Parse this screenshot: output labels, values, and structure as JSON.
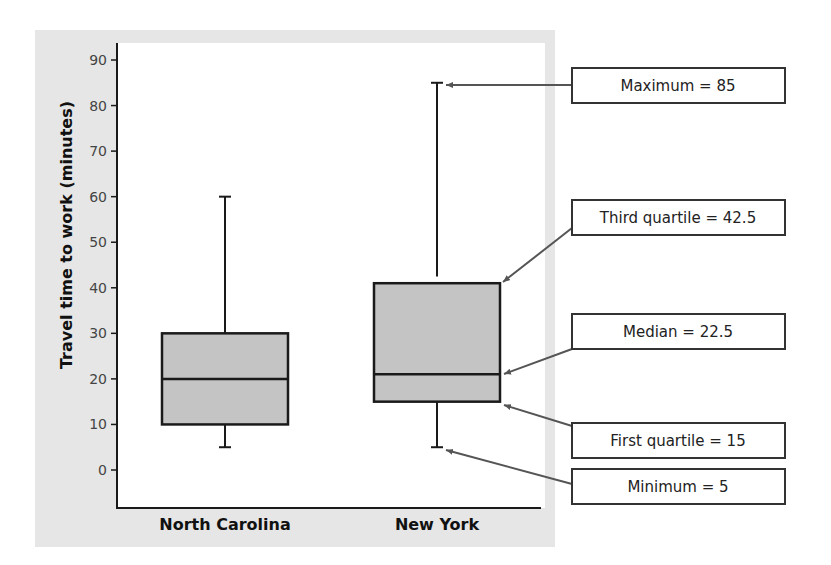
{
  "chart_data": {
    "type": "boxplot",
    "title": "",
    "xlabel": "",
    "ylabel": "Travel time to work (minutes)",
    "ylim": [
      -8,
      93
    ],
    "yticks": [
      0,
      10,
      20,
      30,
      40,
      50,
      60,
      70,
      80,
      90
    ],
    "grid": false,
    "categories": [
      "North Carolina",
      "New York"
    ],
    "series": [
      {
        "name": "North Carolina",
        "min": 5,
        "q1": 10,
        "median": 20,
        "q3": 30,
        "max": 60
      },
      {
        "name": "New York",
        "min": 5,
        "q1": 15,
        "median": 22.5,
        "q3": 42.5,
        "max": 85
      }
    ],
    "annotations": [
      {
        "target": "New York maximum",
        "text": "Maximum = 85"
      },
      {
        "target": "New York third quartile",
        "text": "Third quartile = 42.5"
      },
      {
        "target": "New York median",
        "text": "Median = 22.5"
      },
      {
        "target": "New York first quartile",
        "text": "First quartile = 15"
      },
      {
        "target": "New York minimum",
        "text": "Minimum = 5"
      }
    ]
  },
  "colors": {
    "panel_bg": "#e6e6e6",
    "plot_bg": "#ffffff",
    "box_fill": "#c4c4c4",
    "stroke": "#1a1a1a",
    "arrow": "#555555"
  }
}
